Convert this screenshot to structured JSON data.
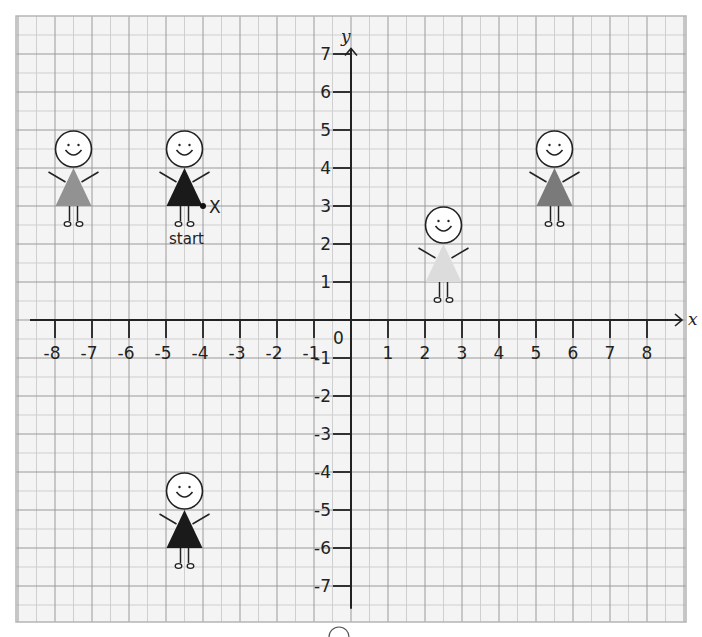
{
  "grid": {
    "left": 16,
    "top": 16,
    "right": 686,
    "bottom": 622,
    "background": "#f4f4f4",
    "major_color": "#9a9a9a",
    "minor_color": "#cfcfcf",
    "border_color": "#b5b5b5"
  },
  "axes": {
    "origin_px": [
      351,
      320
    ],
    "x_unit_px": 37,
    "y_unit_px": 38,
    "x_label": "x",
    "y_label": "y",
    "origin_label": "0",
    "x_ticks": [
      -8,
      -7,
      -6,
      -5,
      -4,
      -3,
      -2,
      -1,
      1,
      2,
      3,
      4,
      5,
      6,
      7,
      8
    ],
    "y_ticks": [
      7,
      6,
      5,
      4,
      3,
      2,
      1,
      -1,
      -2,
      -3,
      -4,
      -5,
      -6,
      -7
    ],
    "x_range": [
      -8.5,
      9
    ],
    "y_range": [
      -7.6,
      7.2
    ]
  },
  "figures": [
    {
      "id": "gray-figure",
      "base_center": [
        -7.5,
        3
      ],
      "dress_color": "#929292"
    },
    {
      "id": "start-figure",
      "base_center": [
        -4.5,
        3
      ],
      "dress_color": "#1a1a1a"
    },
    {
      "id": "light-figure",
      "base_center": [
        2.5,
        1
      ],
      "dress_color": "#dcdcdc"
    },
    {
      "id": "darkgray-figure",
      "base_center": [
        5.5,
        3
      ],
      "dress_color": "#7a7a7a"
    },
    {
      "id": "bottom-figure",
      "base_center": [
        -4.5,
        -6
      ],
      "dress_color": "#1a1a1a"
    }
  ],
  "marker": {
    "point": [
      -4,
      3
    ],
    "label": "X",
    "caption": "start"
  },
  "chart_data": {
    "type": "scatter",
    "title": "",
    "xlabel": "x",
    "ylabel": "y",
    "xlim": [
      -8,
      8
    ],
    "ylim": [
      -7,
      7
    ],
    "grid": true,
    "points": [
      {
        "name": "gray figure (dress base centre)",
        "x": -7.5,
        "y": 3
      },
      {
        "name": "black figure at start (dress base centre)",
        "x": -4.5,
        "y": 3
      },
      {
        "name": "light grey figure (dress base centre)",
        "x": 2.5,
        "y": 1
      },
      {
        "name": "dark grey figure (dress base centre)",
        "x": 5.5,
        "y": 3
      },
      {
        "name": "black figure bottom (dress base centre)",
        "x": -4.5,
        "y": -6
      },
      {
        "name": "point X (start)",
        "x": -4,
        "y": 3
      }
    ],
    "annotations": [
      "X",
      "start",
      "0"
    ]
  }
}
